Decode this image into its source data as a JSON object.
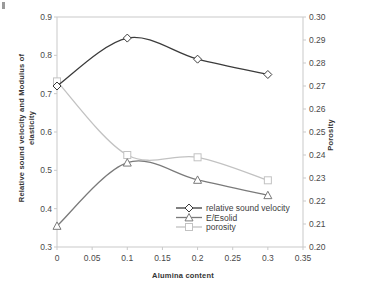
{
  "chart_data": {
    "type": "line",
    "title": "",
    "xlabel": "Alumina content",
    "ylabel": "Relative sound velocity and Modulus of\nelasticity",
    "y2label": "Porosity",
    "x": [
      0,
      0.1,
      0.2,
      0.3
    ],
    "xlim": [
      0,
      0.35
    ],
    "ylim": [
      0.3,
      0.9
    ],
    "y2lim": [
      0.2,
      0.3
    ],
    "xticks": [
      "0",
      "0.05",
      "0.1",
      "0.15",
      "0.2",
      "0.25",
      "0.3",
      "0.35"
    ],
    "xtick_values": [
      0,
      0.05,
      0.1,
      0.15,
      0.2,
      0.25,
      0.3,
      0.35
    ],
    "yticks": [
      "0.3",
      "0.4",
      "0.5",
      "0.6",
      "0.7",
      "0.8",
      "0.9"
    ],
    "ytick_values": [
      0.3,
      0.4,
      0.5,
      0.6,
      0.7,
      0.8,
      0.9
    ],
    "y2ticks": [
      "0.20",
      "0.21",
      "0.22",
      "0.23",
      "0.24",
      "0.25",
      "0.26",
      "0.27",
      "0.28",
      "0.29",
      "0.30"
    ],
    "y2tick_values": [
      0.2,
      0.21,
      0.22,
      0.23,
      0.24,
      0.25,
      0.26,
      0.27,
      0.28,
      0.29,
      0.3
    ],
    "grid": false,
    "legend_position": "inside-lower-center",
    "series": [
      {
        "name": "relative sound velocity",
        "axis": "left",
        "marker": "diamond",
        "color": "#3b3b3b",
        "values": [
          0.72,
          0.845,
          0.79,
          0.75
        ]
      },
      {
        "name": "E/Esolid",
        "axis": "left",
        "marker": "triangle",
        "color": "#7a7a7a",
        "values": [
          0.355,
          0.52,
          0.475,
          0.435
        ]
      },
      {
        "name": "porosity",
        "axis": "right",
        "marker": "square",
        "color": "#c2c2c2",
        "values": [
          0.272,
          0.24,
          0.239,
          0.229
        ]
      }
    ]
  },
  "legend": {
    "items": [
      {
        "label": "relative sound velocity"
      },
      {
        "label": "E/Esolid"
      },
      {
        "label": "porosity"
      }
    ]
  },
  "colors": {
    "axis": "#c9c9c9",
    "text": "#3a3a3a",
    "series_1": "#3b3b3b",
    "series_2": "#7a7a7a",
    "series_3": "#c2c2c2",
    "background": "#ffffff"
  }
}
